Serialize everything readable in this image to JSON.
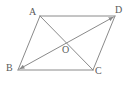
{
  "figure": {
    "kind": "geometry-diagram",
    "shape": "parallelogram-with-diagonals",
    "width": 132,
    "height": 85,
    "background_color": "#ffffff",
    "stroke_color": "#8a8a8a",
    "label_color": "#5a5a5a",
    "stroke_width": 1
  },
  "labels": {
    "a": "A",
    "b": "B",
    "c": "C",
    "d": "D",
    "o": "O"
  },
  "points": {
    "A": {
      "x": 40,
      "y": 16
    },
    "B": {
      "x": 18,
      "y": 70
    },
    "C": {
      "x": 93,
      "y": 70
    },
    "D": {
      "x": 115,
      "y": 16
    },
    "O": {
      "x": 66,
      "y": 43
    }
  },
  "segments": [
    {
      "name": "side-AD",
      "from": "A",
      "to": "D",
      "arrow": "none"
    },
    {
      "name": "side-DC",
      "from": "D",
      "to": "C",
      "arrow": "none"
    },
    {
      "name": "side-CB",
      "from": "C",
      "to": "B",
      "arrow": "none"
    },
    {
      "name": "side-BA",
      "from": "B",
      "to": "A",
      "arrow": "none"
    },
    {
      "name": "diagonal-AC",
      "from": "A",
      "to": "C",
      "arrow": "none"
    },
    {
      "name": "diagonal-BD",
      "from": "B",
      "to": "D",
      "arrow": "both"
    }
  ]
}
